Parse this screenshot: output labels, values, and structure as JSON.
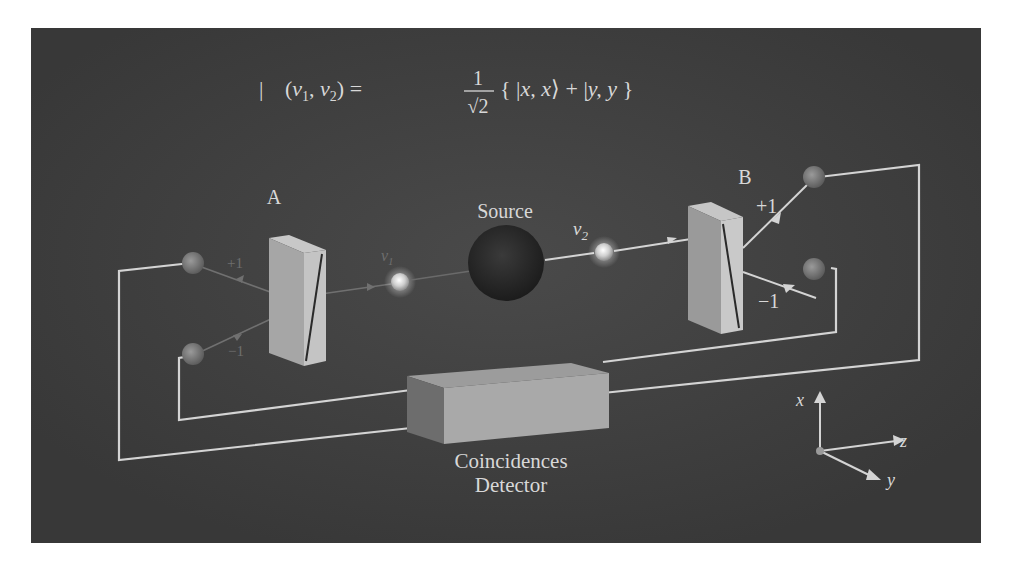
{
  "figure": {
    "title_equation": {
      "prefix": "|",
      "lhs": "(v1, v2) =",
      "lhs_parts": [
        "(",
        "v",
        "1",
        ", ",
        "v",
        "2",
        ") ="
      ],
      "fraction_numerator": "1",
      "fraction_denominator": "√2",
      "rhs": "{ |x, x⟩ + |y, y }",
      "rhs_parts": [
        "{ |",
        "x, x",
        "⟩ + |",
        "y, y",
        " }"
      ]
    },
    "analyzer_a": {
      "label": "A",
      "plus_label": "+1",
      "minus_label": "−1"
    },
    "analyzer_b": {
      "label": "B",
      "plus_label": "+1",
      "minus_label": "−1"
    },
    "source": {
      "label": "Source"
    },
    "photon_1": {
      "label": "v",
      "subscript": "1"
    },
    "photon_2": {
      "label": "v",
      "subscript": "2"
    },
    "detector": {
      "label_line1": "Coincidences",
      "label_line2": "Detector"
    },
    "axes": {
      "x": "x",
      "y": "y",
      "z": "z"
    },
    "colors": {
      "background": "#3c3c3c",
      "page": "#ffffff",
      "wire": "#d4d4d4",
      "text": "#d8d8d8",
      "source_sphere": "#242424",
      "analyzer_front": "#bdbdbd",
      "analyzer_side": "#8e8e8e",
      "detector_front": "#a8a8a8",
      "detector_side": "#6f6f6f"
    }
  }
}
